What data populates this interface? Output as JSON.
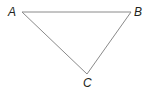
{
  "diagram": {
    "type": "triangle",
    "stroke_color": "#8a8a8a",
    "label_color": "#231f20",
    "vertices": [
      {
        "name": "A",
        "x": 22,
        "y": 12
      },
      {
        "name": "B",
        "x": 131,
        "y": 12
      },
      {
        "name": "C",
        "x": 87,
        "y": 74
      }
    ],
    "labels": {
      "a": "A",
      "b": "B",
      "c": "C"
    }
  }
}
